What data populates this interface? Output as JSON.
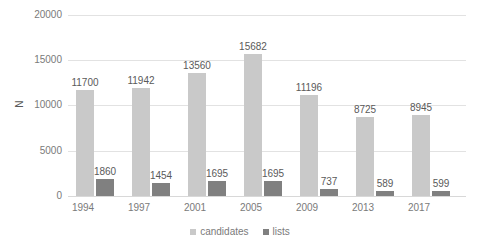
{
  "chart_data": {
    "type": "bar",
    "title": "",
    "subtitle": "",
    "xlabel": "",
    "ylabel": "N",
    "categories": [
      "1994",
      "1997",
      "2001",
      "2005",
      "2009",
      "2013",
      "2017"
    ],
    "series": [
      {
        "name": "candidates",
        "color": "#c9c9c9",
        "values": [
          11700,
          11942,
          13560,
          15682,
          11196,
          8725,
          8945
        ]
      },
      {
        "name": "lists",
        "color": "#808080",
        "values": [
          1860,
          1454,
          1695,
          1695,
          737,
          589,
          599
        ]
      }
    ],
    "ylim": [
      0,
      20000
    ],
    "yticks": [
      0,
      5000,
      10000,
      15000,
      20000
    ],
    "ytick_labels": [
      "0",
      "5000",
      "10000",
      "15000",
      "20000"
    ],
    "grid": true,
    "grid_axis": "y",
    "legend_position": "bottom",
    "data_labels": true,
    "background": "#ffffff",
    "grid_color": "#e2e2e2",
    "text_color": "#7a7a7a",
    "label_color": "#5a5a5a"
  },
  "legend": {
    "items": [
      {
        "label": "candidates",
        "color": "#c9c9c9"
      },
      {
        "label": "lists",
        "color": "#808080"
      }
    ]
  }
}
